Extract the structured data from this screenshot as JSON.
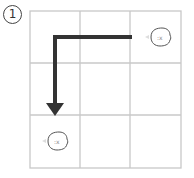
{
  "figure": {
    "label": "1",
    "grid": {
      "rows": 3,
      "cols": 3,
      "line_color": "#c8c8c8"
    },
    "characters": [
      {
        "name": "chick",
        "row": 0,
        "col": 2,
        "facing": "left"
      },
      {
        "name": "chick",
        "row": 2,
        "col": 0,
        "facing": "left"
      }
    ],
    "path": {
      "from": [
        0,
        2
      ],
      "via": [
        0,
        0
      ],
      "to": [
        2,
        0
      ],
      "color": "#333333"
    }
  }
}
